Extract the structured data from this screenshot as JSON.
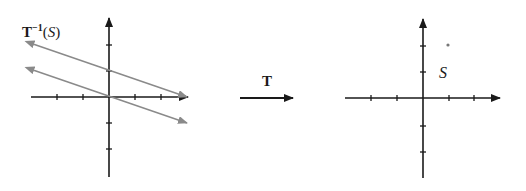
{
  "left_plot": {
    "title_main": "T",
    "title_sup": "−1",
    "title_paren_open": "(",
    "title_set": "S",
    "title_paren_close": ")",
    "origin_px": [
      109,
      97
    ],
    "unit_px": 26,
    "x_ticks": [
      -2,
      -1,
      1,
      2
    ],
    "y_ticks": [
      2,
      1,
      -1,
      -2
    ],
    "lines": [
      {
        "name": "upper-line",
        "from": [
          -3,
          2
        ],
        "to": [
          3,
          0
        ],
        "color": "#8a8a8a"
      },
      {
        "name": "lower-line",
        "from": [
          -3,
          1
        ],
        "to": [
          3,
          -1
        ],
        "color": "#8a8a8a"
      }
    ]
  },
  "transform_arrow": {
    "label": "T"
  },
  "right_plot": {
    "set_label": "S",
    "origin_px": [
      423,
      98
    ],
    "unit_px": 26,
    "x_ticks": [
      -2,
      -1,
      1,
      2
    ],
    "y_ticks": [
      2,
      1,
      -1,
      -2
    ],
    "point": [
      1,
      2
    ]
  },
  "colors": {
    "axis": "#1a1a1a",
    "line": "#8a8a8a",
    "point": "#777777"
  }
}
